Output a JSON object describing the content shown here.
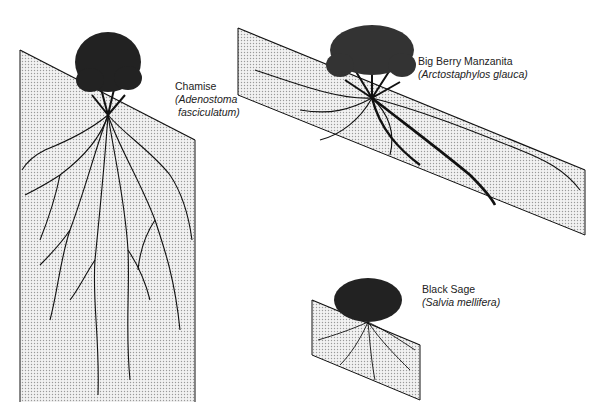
{
  "plants": [
    {
      "common_name": "Chamise",
      "scientific_name": "(Adenostoma",
      "scientific_name_2": "fasciculatum)"
    },
    {
      "common_name": "Big Berry Manzanita",
      "scientific_name": "(Arctostaphylos glauca)"
    },
    {
      "common_name": "Black Sage",
      "scientific_name": "(Salvia mellifera)"
    }
  ],
  "colors": {
    "soil": "#e2e2e2",
    "ink": "#111111"
  }
}
